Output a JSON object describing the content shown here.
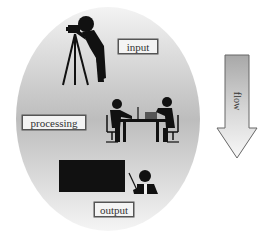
{
  "diagram": {
    "stages": [
      {
        "id": "input",
        "label": "input",
        "icon": "photographer-with-camera-tripod-icon"
      },
      {
        "id": "processing",
        "label": "processing",
        "icon": "two-people-working-at-desk-icon"
      },
      {
        "id": "output",
        "label": "output",
        "icon": "presenter-at-blackboard-icon"
      }
    ],
    "arrow": {
      "label": "flow",
      "direction": "down"
    },
    "colors": {
      "ellipse_light": "#f2f2f2",
      "ellipse_dark": "#bcbcbc",
      "figure": "#111111",
      "label_border": "#555555"
    }
  }
}
